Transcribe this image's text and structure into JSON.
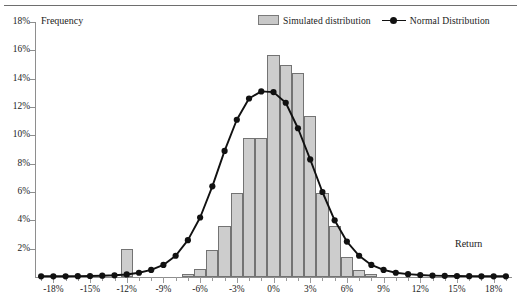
{
  "figure": {
    "frequency_axis_title": "Frequency",
    "return_axis_title": "Return"
  },
  "legend": {
    "position": "top-right",
    "items": [
      {
        "label": "Simulated distribution",
        "kind": "bar-swatch",
        "color": "#cdcdcd"
      },
      {
        "label": "Normal Distribution",
        "kind": "line-marker",
        "color": "#111111"
      }
    ]
  },
  "chart_data": {
    "type": "bar",
    "title": "",
    "subtitle": "",
    "xlabel": "Return",
    "ylabel": "Frequency",
    "xlim": [
      -19.5,
      19.5
    ],
    "ylim": [
      0,
      18
    ],
    "grid": false,
    "legend_position": "top-right",
    "ytick_labels": [
      "18%",
      "16%",
      "14%",
      "12%",
      "10%",
      "8%",
      "6%",
      "4%",
      "2%"
    ],
    "ytick_values": [
      18,
      16,
      14,
      12,
      10,
      8,
      6,
      4,
      2
    ],
    "xtick_labels": [
      "-18%",
      "-15%",
      "-12%",
      "-9%",
      "-6%",
      "-3%",
      "0%",
      "3%",
      "6%",
      "9%",
      "12%",
      "15%",
      "18%"
    ],
    "xtick_values": [
      -18,
      -15,
      -12,
      -9,
      -6,
      -3,
      0,
      3,
      6,
      9,
      12,
      15,
      18
    ],
    "bin_width": 1,
    "series": [
      {
        "name": "Simulated distribution",
        "type": "bar",
        "color": "#cdcdcd",
        "x": [
          -19,
          -18,
          -17,
          -16,
          -15,
          -14,
          -13,
          -12,
          -11,
          -10,
          -9,
          -8,
          -7,
          -6,
          -5,
          -4,
          -3,
          -2,
          -1,
          0,
          1,
          2,
          3,
          4,
          5,
          6,
          7,
          8,
          9,
          10,
          11,
          12,
          13,
          14,
          15,
          16,
          17,
          18,
          19
        ],
        "values": [
          0,
          0,
          0,
          0,
          0,
          0,
          0,
          2.0,
          0,
          0,
          0,
          0,
          0.2,
          0.6,
          1.9,
          3.6,
          5.9,
          9.8,
          9.8,
          15.7,
          15.0,
          14.4,
          11.4,
          5.9,
          3.6,
          1.4,
          0.5,
          0.2,
          0,
          0,
          0,
          0,
          0,
          0,
          0,
          0,
          0,
          0,
          0
        ]
      },
      {
        "name": "Normal Distribution",
        "type": "line",
        "color": "#111111",
        "marker": "filled-circle",
        "x": [
          -19,
          -18,
          -17,
          -16,
          -15,
          -14,
          -13,
          -12,
          -11,
          -10,
          -9,
          -8,
          -7,
          -6,
          -5,
          -4,
          -3,
          -2,
          -1,
          0,
          1,
          2,
          3,
          4,
          5,
          6,
          7,
          8,
          9,
          10,
          11,
          12,
          13,
          14,
          15,
          16,
          17,
          18,
          19
        ],
        "values": [
          0.05,
          0.05,
          0.05,
          0.06,
          0.07,
          0.09,
          0.12,
          0.18,
          0.3,
          0.5,
          0.85,
          1.5,
          2.6,
          4.2,
          6.4,
          8.9,
          11.1,
          12.6,
          13.1,
          13.05,
          12.3,
          10.5,
          8.3,
          6.0,
          4.0,
          2.5,
          1.5,
          0.85,
          0.5,
          0.3,
          0.2,
          0.14,
          0.1,
          0.08,
          0.07,
          0.06,
          0.05,
          0.05,
          0.05
        ]
      }
    ]
  }
}
